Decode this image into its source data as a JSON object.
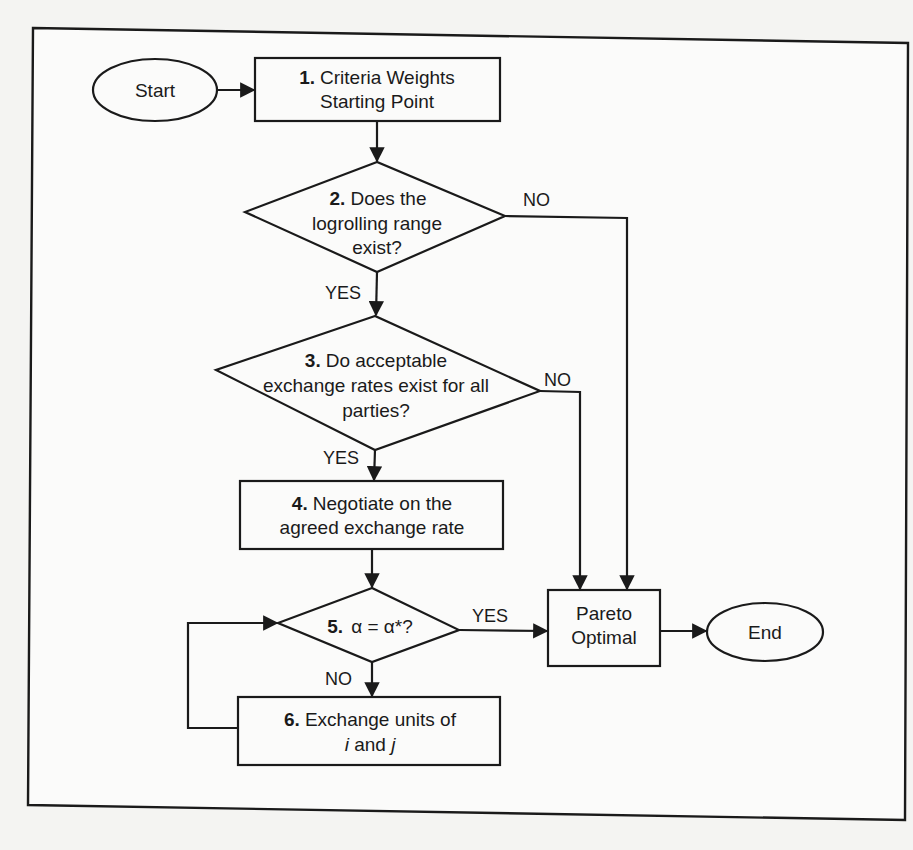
{
  "diagram": {
    "type": "flowchart",
    "nodes": {
      "start": {
        "label": "Start",
        "shape": "ellipse"
      },
      "step1": {
        "num": "1.",
        "line1": "Criteria Weights",
        "line2": "Starting Point",
        "shape": "rect"
      },
      "step2": {
        "num": "2.",
        "line1": "Does the",
        "line2": "logrolling range",
        "line3": "exist?",
        "shape": "diamond"
      },
      "step3": {
        "num": "3.",
        "line1": "Do acceptable",
        "line2": "exchange rates exist for all",
        "line3": "parties?",
        "shape": "diamond"
      },
      "step4": {
        "num": "4.",
        "line1": "Negotiate on the",
        "line2": "agreed exchange rate",
        "shape": "rect"
      },
      "step5": {
        "num": "5.",
        "line1": "α = α*?",
        "shape": "diamond"
      },
      "step6": {
        "num": "6.",
        "line1": "Exchange units of",
        "var_i": "i",
        "and": " and ",
        "var_j": "j",
        "shape": "rect"
      },
      "pareto": {
        "line1": "Pareto",
        "line2": "Optimal",
        "shape": "rect"
      },
      "end": {
        "label": "End",
        "shape": "ellipse"
      }
    },
    "edges": [
      {
        "from": "start",
        "to": "step1",
        "label": ""
      },
      {
        "from": "step1",
        "to": "step2",
        "label": ""
      },
      {
        "from": "step2",
        "to": "step3",
        "label": "YES"
      },
      {
        "from": "step2",
        "to": "pareto",
        "label": "NO"
      },
      {
        "from": "step3",
        "to": "step4",
        "label": "YES"
      },
      {
        "from": "step3",
        "to": "pareto",
        "label": "NO"
      },
      {
        "from": "step4",
        "to": "step5",
        "label": ""
      },
      {
        "from": "step5",
        "to": "pareto",
        "label": "YES"
      },
      {
        "from": "step5",
        "to": "step6",
        "label": "NO"
      },
      {
        "from": "step6",
        "to": "step5",
        "label": ""
      },
      {
        "from": "pareto",
        "to": "end",
        "label": ""
      }
    ],
    "edge_labels": {
      "s2_yes": "YES",
      "s2_no": "NO",
      "s3_yes": "YES",
      "s3_no": "NO",
      "s5_yes": "YES",
      "s5_no": "NO"
    }
  }
}
